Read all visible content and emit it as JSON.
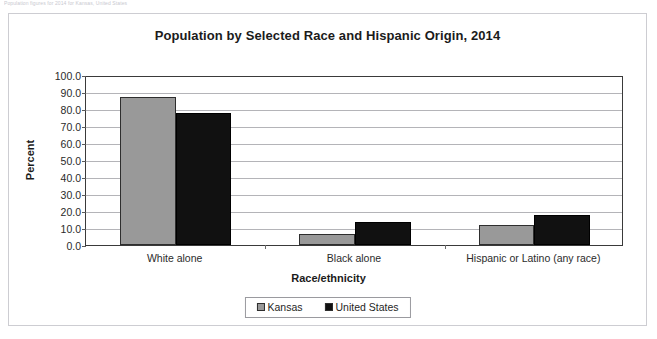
{
  "page": {
    "topnote": "Population figures for 2014 for Kansas, United States"
  },
  "chart_data": {
    "type": "bar",
    "title": "Population by Selected Race and Hispanic Origin, 2014",
    "xlabel": "Race/ethnicity",
    "ylabel": "Percent",
    "ylim": [
      0,
      100
    ],
    "ytick_step": 10,
    "ytick_labels": [
      "0.0",
      "10.0",
      "20.0",
      "30.0",
      "40.0",
      "50.0",
      "60.0",
      "70.0",
      "80.0",
      "90.0",
      "100.0"
    ],
    "ytick_values": [
      0,
      10,
      20,
      30,
      40,
      50,
      60,
      70,
      80,
      90,
      100
    ],
    "grid": true,
    "legend_position": "bottom",
    "categories": [
      "White alone",
      "Black alone",
      "Hispanic or Latino (any race)"
    ],
    "series": [
      {
        "name": "Kansas",
        "color": "#999999",
        "values": [
          87.0,
          6.3,
          11.5
        ]
      },
      {
        "name": "United States",
        "color": "#111111",
        "values": [
          77.9,
          13.8,
          17.5
        ]
      }
    ]
  }
}
